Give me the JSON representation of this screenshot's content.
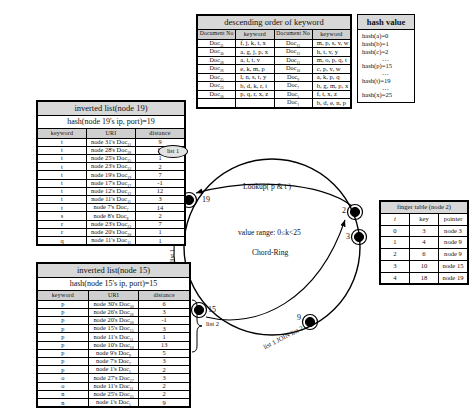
{
  "keyword_table": {
    "title": "descending order of keyword",
    "headers": {
      "doc": "Document No",
      "keyword": "keyword"
    },
    "left_rows": [
      {
        "doc": "Doc",
        "sub": "31",
        "words": "f, j, k, t, x"
      },
      {
        "doc": "Doc",
        "sub": "30",
        "words": "a, g, j, p, x"
      },
      {
        "doc": "Doc",
        "sub": "28",
        "words": "a, i, t, v"
      },
      {
        "doc": "Doc",
        "sub": "26",
        "words": "e, k, m, p"
      },
      {
        "doc": "Doc",
        "sub": "25",
        "words": "l, n, s, t, y"
      },
      {
        "doc": "Doc",
        "sub": "23",
        "words": "b, d, k, r, t"
      },
      {
        "doc": "Doc",
        "sub": "20",
        "words": "p, q, r, x, z"
      }
    ],
    "right_rows": [
      {
        "doc": "Doc",
        "sub": "15",
        "words": "m, p, s, v, w"
      },
      {
        "doc": "Doc",
        "sub": "12",
        "words": "h, t, v, y"
      },
      {
        "doc": "Doc",
        "sub": "11",
        "words": "m, o, p, q, t"
      },
      {
        "doc": "Doc",
        "sub": "10",
        "words": "c, p, v, w"
      },
      {
        "doc": "Doc",
        "sub": "9",
        "words": "a, k, p, q"
      },
      {
        "doc": "Doc",
        "sub": "7",
        "words": "b, g, m, p, x"
      },
      {
        "doc": "Doc",
        "sub": "5",
        "words": "f, t, x, z"
      },
      {
        "doc": "Doc",
        "sub": "1",
        "words": "b, d, e, n, p"
      }
    ]
  },
  "hash_table": {
    "title": "hash value",
    "rows": [
      "hash(a)=0",
      "hash(b)=1",
      "hash(c)=2",
      "…",
      "hash(p)=15",
      "…",
      "hash(t)=19",
      "…",
      "hash(x)=25"
    ]
  },
  "inverted_list_19": {
    "title": "inverted list(node 19)",
    "hash_line": "hash(node 19's ip, port)=19",
    "headers": {
      "keyword": "keyword",
      "uri": "URI",
      "distance": "distance"
    },
    "rows": [
      {
        "keyword": "t",
        "uri": "node 31's Doc",
        "sub": "31",
        "distance": "9"
      },
      {
        "keyword": "t",
        "uri": "node 28's Doc",
        "sub": "28",
        "distance": "11"
      },
      {
        "keyword": "t",
        "uri": "node 25's Doc",
        "sub": "25",
        "distance": "1"
      },
      {
        "keyword": "t",
        "uri": "node 23's Doc",
        "sub": "23",
        "distance": "2"
      },
      {
        "keyword": "t",
        "uri": "node 19's Doc",
        "sub": "19",
        "distance": "7"
      },
      {
        "keyword": "t",
        "uri": "node 17's Doc",
        "sub": "17",
        "distance": "-1"
      },
      {
        "keyword": "t",
        "uri": "node 12's Doc",
        "sub": "12",
        "distance": "12"
      },
      {
        "keyword": "t",
        "uri": "node 11's Doc",
        "sub": "11",
        "distance": "3"
      },
      {
        "keyword": "t",
        "uri": "node 7's Doc",
        "sub": "7",
        "distance": "14"
      },
      {
        "keyword": "s",
        "uri": "node 8's Doc",
        "sub": "8",
        "distance": "2"
      },
      {
        "keyword": "r",
        "uri": "node 23's Doc",
        "sub": "23",
        "distance": "7"
      },
      {
        "keyword": "r",
        "uri": "node 20's Doc",
        "sub": "20",
        "distance": "1"
      },
      {
        "keyword": "q",
        "uri": "node 11's Doc",
        "sub": "11",
        "distance": "1"
      }
    ]
  },
  "inverted_list_15": {
    "title": "inverted list(node 15)",
    "hash_line": "hash(node 15's ip, port)=15",
    "headers": {
      "keyword": "keyword",
      "uri": "URI",
      "distance": "distance"
    },
    "rows": [
      {
        "keyword": "p",
        "uri": "node 30's Doc",
        "sub": "30",
        "distance": "6"
      },
      {
        "keyword": "p",
        "uri": "node 26's Doc",
        "sub": "26",
        "distance": "3"
      },
      {
        "keyword": "p",
        "uri": "node 20's Doc",
        "sub": "20",
        "distance": "-1"
      },
      {
        "keyword": "p",
        "uri": "node 15's Doc",
        "sub": "15",
        "distance": "3"
      },
      {
        "keyword": "p",
        "uri": "node 11's Doc",
        "sub": "11",
        "distance": "1"
      },
      {
        "keyword": "p",
        "uri": "node 10's Doc",
        "sub": "10",
        "distance": "13"
      },
      {
        "keyword": "p",
        "uri": "node 9's Doc",
        "sub": "9",
        "distance": "5"
      },
      {
        "keyword": "p",
        "uri": "node 7's Doc",
        "sub": "7",
        "distance": "3"
      },
      {
        "keyword": "p",
        "uri": "node 1's Doc",
        "sub": "1",
        "distance": "2"
      },
      {
        "keyword": "o",
        "uri": "node 27's Doc",
        "sub": "27",
        "distance": "3"
      },
      {
        "keyword": "o",
        "uri": "node 11's Doc",
        "sub": "11",
        "distance": "2"
      },
      {
        "keyword": "n",
        "uri": "node 25's Doc",
        "sub": "25",
        "distance": "2"
      },
      {
        "keyword": "n",
        "uri": "node 1's Doc",
        "sub": "1",
        "distance": "9"
      }
    ]
  },
  "finger_table": {
    "title": "finger table (node 2)",
    "headers": {
      "i": "i",
      "key": "key",
      "pointer": "pointer"
    },
    "rows": [
      {
        "i": "0",
        "key": "3",
        "pointer": "node 3"
      },
      {
        "i": "1",
        "key": "4",
        "pointer": "node 9"
      },
      {
        "i": "2",
        "key": "6",
        "pointer": "node 9"
      },
      {
        "i": "3",
        "key": "10",
        "pointer": "node 15"
      },
      {
        "i": "4",
        "key": "18",
        "pointer": "node 19"
      }
    ]
  },
  "ring": {
    "lookup_label": "Lookup( p & t )",
    "value_range": "value range: 0≤k<25",
    "name": "Chord-Ring",
    "join_label": "list 1 JOIN list 2",
    "list1_bubble": "list 1",
    "list1_side": "list 1",
    "list2_side": "list 2",
    "nodes": [
      {
        "id": "19",
        "label": "19"
      },
      {
        "id": "2",
        "label": "2"
      },
      {
        "id": "3",
        "label": "3"
      },
      {
        "id": "9",
        "label": "9"
      },
      {
        "id": "15",
        "label": "15"
      }
    ]
  }
}
